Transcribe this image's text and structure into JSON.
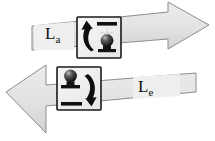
{
  "diagram": {
    "background_color": "#ffffff",
    "arrow_fill": "#e2e2e2",
    "arrow_stroke": "#8a8a8a",
    "box_fill": "#f2f2f2",
    "box_stroke": "#1a1a1a",
    "glyph_color": "#111111",
    "text_color": "#111111"
  },
  "arrows": [
    {
      "id": "absorption-arrow",
      "name": "absorption-arrow",
      "direction": "right",
      "label_base": "L",
      "label_sub": "a",
      "label_full": "La",
      "taper": "wide-left-narrow-right"
    },
    {
      "id": "emission-arrow",
      "name": "emission-arrow",
      "direction": "left",
      "label_base": "L",
      "label_sub": "e",
      "label_full": "Le",
      "taper": "narrow-right-wide-left"
    }
  ],
  "insets": [
    {
      "id": "absorption-inset",
      "name": "absorption-inset-box",
      "transition": "upward",
      "arrow_glyph": "curved-up-arrow",
      "upper_bar": "excited-level-bar",
      "lower_bar": "ground-level-bar",
      "sphere_position": "lower"
    },
    {
      "id": "emission-inset",
      "name": "emission-inset-box",
      "transition": "downward",
      "arrow_glyph": "curved-down-arrow",
      "upper_bar": "excited-level-bar",
      "lower_bar": "ground-level-bar",
      "sphere_position": "upper"
    }
  ]
}
